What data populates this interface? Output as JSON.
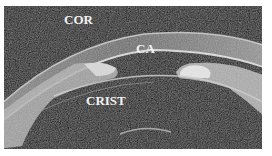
{
  "figure": {
    "labels": [
      {
        "id": "cor",
        "text": "COR"
      },
      {
        "id": "ca",
        "text": "CA"
      },
      {
        "id": "crist",
        "text": "CRIST"
      }
    ],
    "colors": {
      "background": "#0c0c0c",
      "tissue": "#bdbdbd",
      "tissue_bright": "#e6e6e6",
      "label": "#f2f2f2",
      "page": "#ffffff"
    }
  }
}
